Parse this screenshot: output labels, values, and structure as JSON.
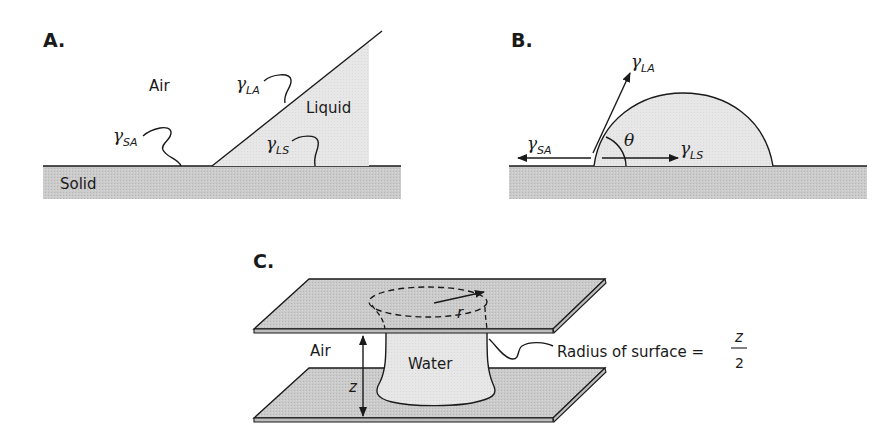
{
  "panels": {
    "a": {
      "label": "A.",
      "air": "Air",
      "liquid": "Liquid",
      "solid": "Solid",
      "gamma_la": {
        "symbol": "γ",
        "sub": "LA"
      },
      "gamma_sa": {
        "symbol": "γ",
        "sub": "SA"
      },
      "gamma_ls": {
        "symbol": "γ",
        "sub": "LS"
      }
    },
    "b": {
      "label": "B.",
      "theta": "θ",
      "gamma_la": {
        "symbol": "γ",
        "sub": "LA"
      },
      "gamma_sa": {
        "symbol": "γ",
        "sub": "SA"
      },
      "gamma_ls": {
        "symbol": "γ",
        "sub": "LS"
      }
    },
    "c": {
      "label": "C.",
      "air": "Air",
      "water": "Water",
      "r": "r",
      "z": "z",
      "radius_text": "Radius of surface =",
      "frac_num": "z",
      "frac_den": "2"
    }
  },
  "colors": {
    "solid": "#c9c9c9",
    "liquid": "#e6e6e6",
    "line": "#1a1a1a"
  }
}
